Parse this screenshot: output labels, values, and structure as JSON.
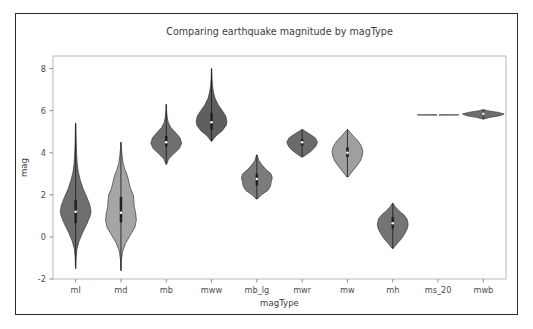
{
  "figure": {
    "title": "Comparing earthquake magnitude by magType",
    "background_color": "#ffffff",
    "border_color": "#2b2b2b"
  },
  "axes": {
    "xlabel": "magType",
    "ylabel": "mag",
    "y_ticks": [
      "8",
      "6",
      "4",
      "2",
      "0",
      "-2"
    ],
    "x_ticks": [
      "ml",
      "md",
      "mb",
      "mww",
      "mb_lg",
      "mwr",
      "mw",
      "mh",
      "ms_20",
      "mwb"
    ]
  },
  "chart_data": {
    "type": "violin",
    "title": "Comparing earthquake magnitude by magType",
    "xlabel": "magType",
    "ylabel": "mag",
    "categories": [
      "ml",
      "md",
      "mb",
      "mww",
      "mb_lg",
      "mwr",
      "mw",
      "mh",
      "ms_20",
      "mwb"
    ],
    "ylim": [
      -2,
      8.6
    ],
    "y_ticks": [
      8,
      6,
      4,
      2,
      0,
      -2
    ],
    "grid": false,
    "legend": "none",
    "violins": [
      {
        "category": "ml",
        "color": "#6e6e6e",
        "min": -1.5,
        "max": 5.4,
        "q1": 0.65,
        "median": 1.2,
        "q3": 1.75,
        "whisker_low": -1.5,
        "whisker_high": 5.4,
        "half_width": 0.34,
        "density": [
          {
            "v": -1.5,
            "w": 0.01
          },
          {
            "v": -1.0,
            "w": 0.03
          },
          {
            "v": -0.6,
            "w": 0.08
          },
          {
            "v": -0.2,
            "w": 0.22
          },
          {
            "v": 0.2,
            "w": 0.45
          },
          {
            "v": 0.6,
            "w": 0.72
          },
          {
            "v": 1.0,
            "w": 0.94
          },
          {
            "v": 1.2,
            "w": 1.0
          },
          {
            "v": 1.5,
            "w": 0.93
          },
          {
            "v": 1.9,
            "w": 0.72
          },
          {
            "v": 2.3,
            "w": 0.48
          },
          {
            "v": 2.7,
            "w": 0.3
          },
          {
            "v": 3.1,
            "w": 0.17
          },
          {
            "v": 3.5,
            "w": 0.1
          },
          {
            "v": 4.0,
            "w": 0.06
          },
          {
            "v": 4.5,
            "w": 0.035
          },
          {
            "v": 5.0,
            "w": 0.02
          },
          {
            "v": 5.4,
            "w": 0.01
          }
        ]
      },
      {
        "category": "md",
        "color": "#a5a5a5",
        "min": -1.6,
        "max": 4.5,
        "q1": 0.7,
        "median": 1.15,
        "q3": 1.9,
        "whisker_low": -1.6,
        "whisker_high": 4.5,
        "half_width": 0.34,
        "density": [
          {
            "v": -1.6,
            "w": 0.01
          },
          {
            "v": -1.1,
            "w": 0.03
          },
          {
            "v": -0.7,
            "w": 0.1
          },
          {
            "v": -0.3,
            "w": 0.3
          },
          {
            "v": 0.1,
            "w": 0.62
          },
          {
            "v": 0.45,
            "w": 0.9
          },
          {
            "v": 0.8,
            "w": 1.0
          },
          {
            "v": 1.15,
            "w": 0.95
          },
          {
            "v": 1.45,
            "w": 0.86
          },
          {
            "v": 1.7,
            "w": 0.84
          },
          {
            "v": 2.0,
            "w": 0.8
          },
          {
            "v": 2.3,
            "w": 0.62
          },
          {
            "v": 2.6,
            "w": 0.52
          },
          {
            "v": 2.9,
            "w": 0.42
          },
          {
            "v": 3.2,
            "w": 0.26
          },
          {
            "v": 3.5,
            "w": 0.14
          },
          {
            "v": 3.9,
            "w": 0.07
          },
          {
            "v": 4.2,
            "w": 0.03
          },
          {
            "v": 4.5,
            "w": 0.01
          }
        ]
      },
      {
        "category": "mb",
        "color": "#6e6e6e",
        "min": 3.45,
        "max": 6.3,
        "q1": 4.3,
        "median": 4.5,
        "q3": 4.8,
        "whisker_low": 3.45,
        "whisker_high": 6.3,
        "half_width": 0.34,
        "density": [
          {
            "v": 3.45,
            "w": 0.02
          },
          {
            "v": 3.7,
            "w": 0.15
          },
          {
            "v": 3.95,
            "w": 0.48
          },
          {
            "v": 4.2,
            "w": 0.85
          },
          {
            "v": 4.45,
            "w": 1.0
          },
          {
            "v": 4.7,
            "w": 0.9
          },
          {
            "v": 4.95,
            "w": 0.62
          },
          {
            "v": 5.2,
            "w": 0.3
          },
          {
            "v": 5.45,
            "w": 0.13
          },
          {
            "v": 5.7,
            "w": 0.06
          },
          {
            "v": 6.0,
            "w": 0.025
          },
          {
            "v": 6.3,
            "w": 0.01
          }
        ]
      },
      {
        "category": "mww",
        "color": "#5f5f5f",
        "min": 4.55,
        "max": 8.0,
        "q1": 5.1,
        "median": 5.45,
        "q3": 5.9,
        "whisker_low": 4.55,
        "whisker_high": 8.0,
        "half_width": 0.34,
        "density": [
          {
            "v": 4.55,
            "w": 0.03
          },
          {
            "v": 4.8,
            "w": 0.28
          },
          {
            "v": 5.05,
            "w": 0.7
          },
          {
            "v": 5.3,
            "w": 0.95
          },
          {
            "v": 5.5,
            "w": 1.0
          },
          {
            "v": 5.75,
            "w": 0.92
          },
          {
            "v": 6.0,
            "w": 0.7
          },
          {
            "v": 6.3,
            "w": 0.42
          },
          {
            "v": 6.6,
            "w": 0.22
          },
          {
            "v": 6.9,
            "w": 0.12
          },
          {
            "v": 7.2,
            "w": 0.06
          },
          {
            "v": 7.6,
            "w": 0.025
          },
          {
            "v": 8.0,
            "w": 0.01
          }
        ]
      },
      {
        "category": "mb_lg",
        "color": "#7b7b7b",
        "min": 1.8,
        "max": 3.9,
        "q1": 2.45,
        "median": 2.75,
        "q3": 3.0,
        "whisker_low": 1.8,
        "whisker_high": 3.9,
        "half_width": 0.34,
        "density": [
          {
            "v": 1.8,
            "w": 0.04
          },
          {
            "v": 2.0,
            "w": 0.3
          },
          {
            "v": 2.2,
            "w": 0.7
          },
          {
            "v": 2.4,
            "w": 0.88
          },
          {
            "v": 2.6,
            "w": 0.93
          },
          {
            "v": 2.8,
            "w": 1.0
          },
          {
            "v": 3.0,
            "w": 0.92
          },
          {
            "v": 3.2,
            "w": 0.6
          },
          {
            "v": 3.45,
            "w": 0.3
          },
          {
            "v": 3.65,
            "w": 0.12
          },
          {
            "v": 3.9,
            "w": 0.02
          }
        ]
      },
      {
        "category": "mwr",
        "color": "#6b6b6b",
        "min": 3.8,
        "max": 5.1,
        "q1": 4.35,
        "median": 4.5,
        "q3": 4.65,
        "whisker_low": 3.8,
        "whisker_high": 5.1,
        "half_width": 0.34,
        "density": [
          {
            "v": 3.8,
            "w": 0.05
          },
          {
            "v": 3.95,
            "w": 0.35
          },
          {
            "v": 4.1,
            "w": 0.62
          },
          {
            "v": 4.3,
            "w": 0.88
          },
          {
            "v": 4.5,
            "w": 1.0
          },
          {
            "v": 4.7,
            "w": 0.86
          },
          {
            "v": 4.85,
            "w": 0.58
          },
          {
            "v": 5.0,
            "w": 0.25
          },
          {
            "v": 5.1,
            "w": 0.04
          }
        ]
      },
      {
        "category": "mw",
        "color": "#9f9f9f",
        "min": 2.85,
        "max": 5.1,
        "q1": 3.8,
        "median": 4.0,
        "q3": 4.25,
        "whisker_low": 2.85,
        "whisker_high": 5.1,
        "half_width": 0.34,
        "density": [
          {
            "v": 2.85,
            "w": 0.04
          },
          {
            "v": 3.1,
            "w": 0.3
          },
          {
            "v": 3.35,
            "w": 0.58
          },
          {
            "v": 3.6,
            "w": 0.82
          },
          {
            "v": 3.85,
            "w": 0.96
          },
          {
            "v": 4.05,
            "w": 1.0
          },
          {
            "v": 4.3,
            "w": 0.92
          },
          {
            "v": 4.55,
            "w": 0.7
          },
          {
            "v": 4.8,
            "w": 0.38
          },
          {
            "v": 5.0,
            "w": 0.14
          },
          {
            "v": 5.1,
            "w": 0.03
          }
        ]
      },
      {
        "category": "mh",
        "color": "#747474",
        "min": -0.55,
        "max": 1.6,
        "q1": 0.4,
        "median": 0.65,
        "q3": 0.95,
        "whisker_low": -0.55,
        "whisker_high": 1.6,
        "half_width": 0.34,
        "density": [
          {
            "v": -0.55,
            "w": 0.03
          },
          {
            "v": -0.35,
            "w": 0.25
          },
          {
            "v": -0.1,
            "w": 0.55
          },
          {
            "v": 0.15,
            "w": 0.78
          },
          {
            "v": 0.4,
            "w": 0.95
          },
          {
            "v": 0.6,
            "w": 1.0
          },
          {
            "v": 0.85,
            "w": 0.93
          },
          {
            "v": 1.05,
            "w": 0.72
          },
          {
            "v": 1.25,
            "w": 0.4
          },
          {
            "v": 1.45,
            "w": 0.15
          },
          {
            "v": 1.6,
            "w": 0.02
          }
        ]
      },
      {
        "category": "ms_20",
        "color": "#6e6e6e",
        "min": 5.8,
        "max": 5.8,
        "q1": 5.8,
        "median": 5.8,
        "q3": 5.8,
        "whisker_low": 5.8,
        "whisker_high": 5.8,
        "half_width": 0.46,
        "density": [
          {
            "v": 5.79,
            "w": 0.0
          },
          {
            "v": 5.8,
            "w": 1.0
          },
          {
            "v": 5.81,
            "w": 0.0
          }
        ]
      },
      {
        "category": "mwb",
        "color": "#6e6e6e",
        "min": 5.6,
        "max": 6.05,
        "q1": 5.8,
        "median": 5.85,
        "q3": 5.9,
        "whisker_low": 5.6,
        "whisker_high": 6.05,
        "half_width": 0.46,
        "density": [
          {
            "v": 5.6,
            "w": 0.02
          },
          {
            "v": 5.68,
            "w": 0.3
          },
          {
            "v": 5.76,
            "w": 0.78
          },
          {
            "v": 5.84,
            "w": 1.0
          },
          {
            "v": 5.92,
            "w": 0.72
          },
          {
            "v": 6.0,
            "w": 0.2
          },
          {
            "v": 6.05,
            "w": 0.02
          }
        ]
      }
    ]
  }
}
